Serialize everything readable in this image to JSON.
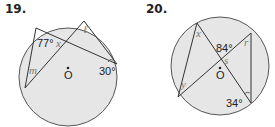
{
  "problems": [
    {
      "number": "19.",
      "center_label": "O",
      "angles": [
        {
          "value": "77°",
          "role": "given"
        },
        {
          "value": "30°",
          "role": "given"
        }
      ],
      "variables": [
        "x",
        "ℓ",
        "m"
      ]
    },
    {
      "number": "20.",
      "center_label": "O",
      "angles": [
        {
          "value": "84°",
          "role": "given"
        },
        {
          "value": "34°",
          "role": "given"
        }
      ],
      "variables": [
        "x",
        "r",
        "s",
        "y"
      ]
    }
  ],
  "colors": {
    "circle_fill": "#e6e6e6",
    "stroke": "#333333",
    "variable_text": "#777777",
    "label_text": "#222222"
  }
}
